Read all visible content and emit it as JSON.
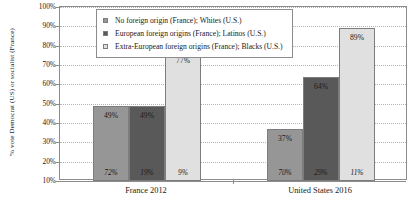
{
  "chart_data": {
    "type": "bar",
    "title": "",
    "xlabel": "",
    "ylabel": "% vote Democrat (US) or socialist (France)",
    "ylim": [
      10,
      100
    ],
    "ytick_labels": [
      "100%",
      "90%",
      "80%",
      "70%",
      "60%",
      "50%",
      "40%",
      "30%",
      "20%",
      "10%"
    ],
    "ytick_values": [
      100,
      90,
      80,
      70,
      60,
      50,
      40,
      30,
      20,
      10
    ],
    "grid": true,
    "legend_position": "top-center",
    "categories": [
      "France 2012",
      "United States 2016"
    ],
    "series": [
      {
        "name": "No foreign origin (France); Whites (U.S.)",
        "color": "#969696",
        "values": [
          49,
          37
        ],
        "value_labels": [
          "49%",
          "37%"
        ],
        "share_labels": [
          "72%",
          "70%"
        ]
      },
      {
        "name": "European foreign origins (France); Latinos (U.S.)",
        "color": "#595959",
        "values": [
          49,
          64
        ],
        "value_labels": [
          "49%",
          "64%"
        ],
        "share_labels": [
          "19%",
          "29%"
        ]
      },
      {
        "name": "Extra-European foreign origins (France); Blacks (U.S.)",
        "color": "#e0e0e0",
        "values": [
          77,
          89
        ],
        "value_labels": [
          "77%",
          "89%"
        ],
        "share_labels": [
          "9%",
          "11%"
        ]
      }
    ]
  }
}
